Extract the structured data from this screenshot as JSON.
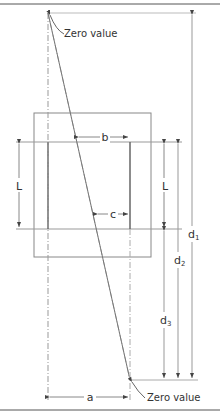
{
  "diagram": {
    "title": "",
    "colors": {
      "frame": "#555555",
      "line": "#888888",
      "light_line": "#bbbbbb",
      "text": "#333333",
      "background": "#ffffff"
    },
    "labels": {
      "zero_value_top": "Zero value",
      "zero_value_bottom": "Zero value",
      "b": "b",
      "c": "c",
      "a": "a",
      "L_left": "L",
      "L_right": "L",
      "d1": "d",
      "d1_sub": "1",
      "d2": "d",
      "d2_sub": "2",
      "d3": "d",
      "d3_sub": "3"
    }
  }
}
